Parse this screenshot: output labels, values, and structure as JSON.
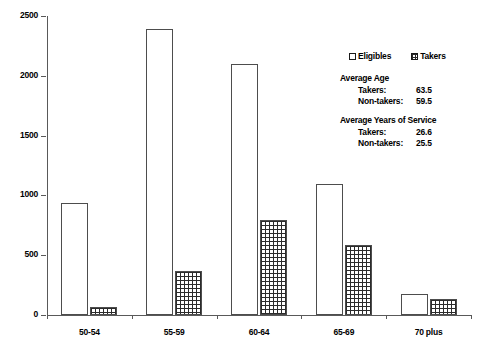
{
  "chart_data": {
    "type": "bar",
    "title": "",
    "subtitle": "",
    "xlabel": "",
    "ylabel": "",
    "categories": [
      "50-54",
      "55-59",
      "60-64",
      "65-69",
      "70 plus"
    ],
    "series": [
      {
        "name": "Eligibles",
        "values": [
          940,
          2390,
          2095,
          1095,
          175
        ]
      },
      {
        "name": "Takers",
        "values": [
          65,
          370,
          795,
          585,
          135
        ]
      }
    ],
    "ylim": [
      0,
      2500
    ],
    "yticks": [
      0,
      500,
      1000,
      1500,
      2000,
      2500
    ],
    "ytick_labels": [
      "0",
      "500",
      "1000",
      "1500",
      "2000",
      "2500"
    ],
    "grid": false,
    "legend_position": "upper right"
  },
  "legend": {
    "entries": [
      {
        "label": "Eligibles",
        "marker": "open-square"
      },
      {
        "label": "Takers",
        "marker": "hatched-square"
      }
    ]
  },
  "annotations": [
    {
      "title": "Average Age",
      "rows": [
        {
          "label": "Takers:",
          "value": "63.5"
        },
        {
          "label": "Non-takers:",
          "value": "59.5"
        }
      ]
    },
    {
      "title": "Average Years of Service",
      "rows": [
        {
          "label": "Takers:",
          "value": "26.6"
        },
        {
          "label": "Non-takers:",
          "value": "25.5"
        }
      ]
    }
  ],
  "colors": {
    "axis": "#595959",
    "bar_outline": "#4d4d4d",
    "hatch": "#2b2b2b",
    "background": "#ffffff",
    "text": "#000000"
  }
}
